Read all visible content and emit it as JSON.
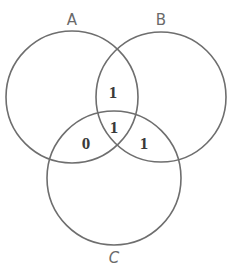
{
  "diagram": {
    "type": "venn-3",
    "sets": [
      {
        "id": "A",
        "label": "A",
        "cx": 72,
        "cy": 97,
        "r": 66
      },
      {
        "id": "B",
        "label": "B",
        "cx": 161,
        "cy": 97,
        "r": 65
      },
      {
        "id": "C",
        "label": "C",
        "cx": 114,
        "cy": 178,
        "r": 67
      }
    ],
    "regions": [
      {
        "name": "A∩B only",
        "value": "1",
        "x": 113,
        "y": 96
      },
      {
        "name": "A∩B∩C",
        "value": "1",
        "x": 114,
        "y": 132
      },
      {
        "name": "A∩C only",
        "value": "0",
        "x": 86,
        "y": 149
      },
      {
        "name": "B∩C only",
        "value": "1",
        "x": 144,
        "y": 149
      }
    ],
    "colors": {
      "stroke": "#6e6e6e",
      "label": "#6a6a6a",
      "value": "#3a3a3a",
      "background": "#ffffff"
    }
  }
}
